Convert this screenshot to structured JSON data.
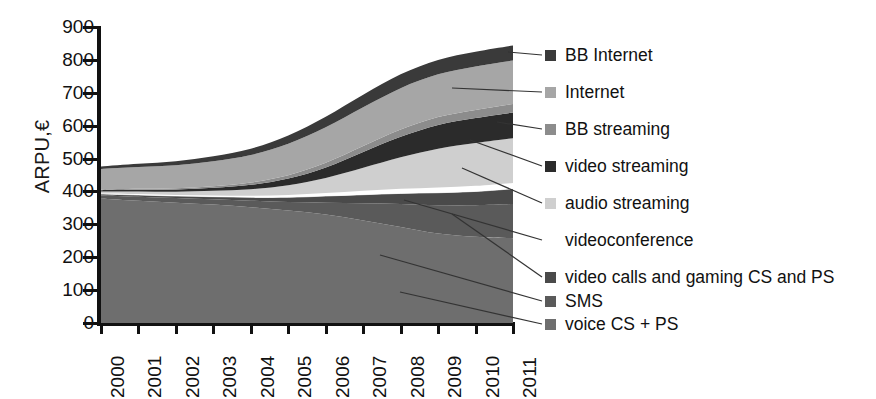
{
  "chart_data": {
    "type": "area",
    "title": "",
    "xlabel": "",
    "ylabel": "ARPU,€",
    "ylim": [
      0,
      900
    ],
    "ytick_step": 100,
    "grid": false,
    "legend_position": "right",
    "stacked": true,
    "categories": [
      "2000",
      "2001",
      "2002",
      "2003",
      "2004",
      "2005",
      "2006",
      "2007",
      "2008",
      "2009",
      "2010",
      "2011"
    ],
    "x": [
      2000,
      2001,
      2002,
      2003,
      2004,
      2005,
      2006,
      2007,
      2008,
      2009,
      2010,
      2011
    ],
    "yticks": [
      900,
      800,
      700,
      600,
      500,
      400,
      300,
      200,
      100,
      0
    ],
    "series": [
      {
        "name": "voice CS + PS",
        "color": "#6e6e6e",
        "values": [
          378,
          372,
          366,
          360,
          352,
          342,
          330,
          312,
          292,
          272,
          262,
          258
        ]
      },
      {
        "name": "SMS",
        "color": "#5a5a5a",
        "values": [
          10,
          12,
          14,
          16,
          20,
          26,
          36,
          52,
          70,
          86,
          96,
          104
        ]
      },
      {
        "name": "video calls and gaming CS and PS",
        "color": "#4a4a4a",
        "values": [
          4,
          5,
          6,
          8,
          10,
          14,
          20,
          26,
          32,
          38,
          42,
          46
        ]
      },
      {
        "name": "videoconference",
        "color": "#ffffff",
        "values": [
          2,
          3,
          3,
          4,
          5,
          7,
          9,
          12,
          14,
          16,
          17,
          18
        ]
      },
      {
        "name": "audio streaming",
        "color": "#cfcfcf",
        "values": [
          6,
          8,
          10,
          14,
          20,
          30,
          46,
          70,
          96,
          118,
          130,
          136
        ]
      },
      {
        "name": "video streaming",
        "color": "#2b2b2b",
        "values": [
          4,
          5,
          7,
          9,
          13,
          20,
          32,
          48,
          62,
          72,
          76,
          78
        ]
      },
      {
        "name": "BB streaming",
        "color": "#8c8c8c",
        "values": [
          2,
          3,
          4,
          5,
          7,
          10,
          14,
          18,
          22,
          24,
          25,
          26
        ]
      },
      {
        "name": "Internet",
        "color": "#a6a6a6",
        "values": [
          62,
          66,
          70,
          76,
          84,
          96,
          108,
          118,
          126,
          130,
          132,
          132
        ]
      },
      {
        "name": "BB Internet",
        "color": "#3a3a3a",
        "values": [
          8,
          10,
          12,
          15,
          19,
          25,
          32,
          38,
          42,
          44,
          45,
          46
        ]
      }
    ],
    "totals": [
      476,
      484,
      492,
      507,
      530,
      570,
      627,
      694,
      756,
      800,
      825,
      844
    ]
  },
  "legend": {
    "items": [
      {
        "label": "BB Internet",
        "color": "#3a3a3a"
      },
      {
        "label": "Internet",
        "color": "#a6a6a6"
      },
      {
        "label": "BB streaming",
        "color": "#8c8c8c"
      },
      {
        "label": "video streaming",
        "color": "#2b2b2b"
      },
      {
        "label": "audio streaming",
        "color": "#cfcfcf"
      },
      {
        "label": "videoconference",
        "color": "transparent"
      },
      {
        "label": "video calls and gaming CS and PS",
        "color": "#4a4a4a"
      },
      {
        "label": "SMS",
        "color": "#5a5a5a"
      },
      {
        "label": "voice CS + PS",
        "color": "#6e6e6e"
      }
    ]
  }
}
